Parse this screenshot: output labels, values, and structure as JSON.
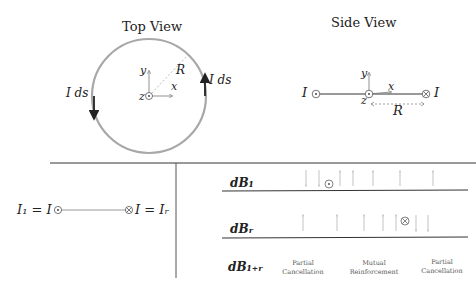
{
  "top_view": {
    "title": "Top View",
    "current_label_left": "I ds",
    "current_label_right": "I ds",
    "radius_label": "R",
    "axis_x": "x",
    "axis_y": "y",
    "axis_z": "z"
  },
  "side_view": {
    "title": "Side View",
    "current_left": "I",
    "current_right": "I",
    "radius_label": "R",
    "axis_x": "x",
    "axis_y": "y",
    "axis_z": "z"
  },
  "bottom_left": {
    "left_label": "I₁ = I",
    "right_label": "I = Iᵣ"
  },
  "field_table": {
    "rows": [
      {
        "label": "dB₁"
      },
      {
        "label": "dBᵣ"
      },
      {
        "label": "dB₁₊ᵣ"
      }
    ],
    "annotations": [
      {
        "line1": "Partial",
        "line2": "Cancellation"
      },
      {
        "line1": "Mutual",
        "line2": "Reinforcement"
      },
      {
        "line1": "Partial",
        "line2": "Cancellation"
      }
    ]
  },
  "colors": {
    "circle": "#a8a8a8",
    "line": "#444444",
    "arrow_light": "#b0b0b0"
  }
}
